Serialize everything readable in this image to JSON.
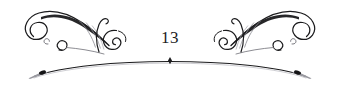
{
  "document": {
    "type": "book-page-ornament",
    "page_number": "13",
    "background_color": "#ffffff",
    "ink_color": "#1b1b1d",
    "ink_color_light": "#7e7e86"
  },
  "ornament": {
    "name": "symmetric-calligraphic-headpiece",
    "left_flourish_label": "left-flourish",
    "right_flourish_label": "right-flourish",
    "rule_label": "arc-rule",
    "center_tick_label": "arc-center-tick",
    "left_tip_label": "arc-left-tip",
    "right_tip_label": "arc-right-tip"
  }
}
